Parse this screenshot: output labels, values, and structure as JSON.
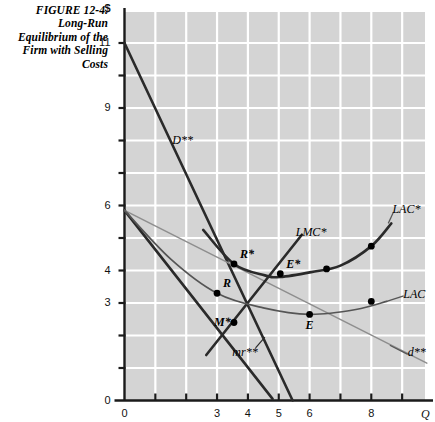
{
  "figure": {
    "caption": "FIGURE 12-4. Long-Run Equilibrium of the Firm with Selling Costs",
    "caption_lines": [
      "FIGURE 12-4.",
      "Long-Run",
      "Equilibrium of the",
      "Firm with Selling",
      "Costs"
    ],
    "currency_symbol": "$",
    "x_axis_symbol": "Q"
  },
  "colors": {
    "plot_background": "#d4d4d4",
    "gridline": "#ffffff",
    "axis": "#1a1a1a",
    "dark_curve": "#2a2a2a",
    "mid_curve": "#555555",
    "light_curve": "#8e8e8e",
    "point": "#000000",
    "text": "#000000"
  },
  "chart_data": {
    "type": "line",
    "title": "FIGURE 12-4. Long-Run Equilibrium of the Firm with Selling Costs",
    "xlabel": "Q",
    "ylabel": "$",
    "xlim": [
      0,
      9.8
    ],
    "ylim": [
      0,
      12.0
    ],
    "grid": true,
    "legend": "inline-curve-labels",
    "x_ticks": [
      0,
      1,
      2,
      3,
      4,
      5,
      6,
      7,
      8,
      9
    ],
    "x_tick_labels": [
      "0",
      "",
      "",
      "3",
      "4",
      "5",
      "6",
      "",
      "8",
      ""
    ],
    "y_ticks": [
      0,
      1,
      2,
      3,
      4,
      5,
      6,
      7,
      8,
      9,
      10,
      11
    ],
    "y_tick_labels": [
      "0",
      "",
      "",
      "3",
      "4",
      "",
      "6",
      "",
      "",
      "9",
      "",
      "11"
    ],
    "series": [
      {
        "name": "D**",
        "label": "D**",
        "style": "dark-thick-straight",
        "label_xy": [
          1.55,
          8.0
        ],
        "points": [
          [
            0,
            11.0
          ],
          [
            5.45,
            0.0
          ]
        ]
      },
      {
        "name": "mr**",
        "label": "mr**",
        "style": "dark-thick-straight",
        "label_xy": [
          3.95,
          1.45
        ],
        "points": [
          [
            0,
            5.85
          ],
          [
            4.8,
            0.05
          ]
        ]
      },
      {
        "name": "d**",
        "label": "d**",
        "style": "light-thin-straight",
        "label_xy": [
          9.25,
          1.45
        ],
        "points": [
          [
            0,
            5.85
          ],
          [
            9.8,
            1.15
          ]
        ]
      },
      {
        "name": "LMC*",
        "label": "LMC*",
        "style": "dark-thick-straight",
        "label_xy": [
          5.55,
          5.15
        ],
        "points": [
          [
            2.65,
            1.4
          ],
          [
            5.75,
            5.1
          ]
        ]
      },
      {
        "name": "LAC*",
        "label": "LAC*",
        "style": "dark-thick-curve",
        "label_xy": [
          8.75,
          5.85
        ],
        "points": [
          [
            2.55,
            5.25
          ],
          [
            3.55,
            4.2
          ],
          [
            4.55,
            3.85
          ],
          [
            5.05,
            3.8
          ],
          [
            6.05,
            3.95
          ],
          [
            7.0,
            4.15
          ],
          [
            8.0,
            4.75
          ],
          [
            8.65,
            5.45
          ]
        ]
      },
      {
        "name": "LAC",
        "label": "LAC",
        "style": "mid-thin-curve",
        "label_xy": [
          9.1,
          3.25
        ],
        "points": [
          [
            0,
            5.85
          ],
          [
            1.5,
            4.35
          ],
          [
            3.0,
            3.3
          ],
          [
            4.5,
            2.85
          ],
          [
            6.0,
            2.65
          ],
          [
            7.5,
            2.8
          ],
          [
            8.5,
            3.05
          ]
        ]
      }
    ],
    "annotated_points": [
      {
        "name": "R*",
        "label": "R*",
        "x": 3.55,
        "y": 4.2,
        "label_pos": "above-right"
      },
      {
        "name": "E*",
        "label": "E*",
        "x": 5.05,
        "y": 3.9,
        "label_pos": "above-right"
      },
      {
        "name": "R",
        "label": "R",
        "x": 3.0,
        "y": 3.3,
        "label_pos": "above-right"
      },
      {
        "name": "M*",
        "label": "M*",
        "x": 3.55,
        "y": 2.4,
        "label_pos": "left"
      },
      {
        "name": "E",
        "label": "E",
        "x": 6.0,
        "y": 2.65,
        "label_pos": "below"
      },
      {
        "name": "lac-star-dot-1",
        "label": "",
        "x": 6.55,
        "y": 4.05,
        "label_pos": "none"
      },
      {
        "name": "lac-star-dot-2",
        "label": "",
        "x": 8.0,
        "y": 4.75,
        "label_pos": "none"
      },
      {
        "name": "lac-dot-1",
        "label": "",
        "x": 8.0,
        "y": 3.05,
        "label_pos": "none"
      }
    ]
  }
}
